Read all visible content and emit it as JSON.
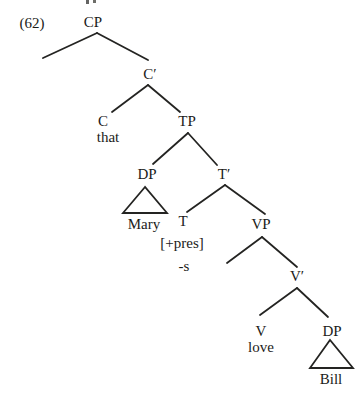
{
  "figure": {
    "example_number": "(62)",
    "kind": "syntax-tree",
    "ink_color": "#242422",
    "paper_color": "#ffffff",
    "sentence_pieces": [
      "that",
      "Mary",
      "[+pres]",
      "-s",
      "love",
      "Bill"
    ]
  },
  "tree": {
    "nodes": [
      {
        "id": "cp",
        "label": "CP",
        "x": 93,
        "y": 22
      },
      {
        "id": "c-bar",
        "label": "C′",
        "x": 150,
        "y": 74
      },
      {
        "id": "c",
        "label": "C",
        "x": 103,
        "y": 121
      },
      {
        "id": "c-word-that",
        "label": "that",
        "x": 108,
        "y": 137
      },
      {
        "id": "tp",
        "label": "TP",
        "x": 187,
        "y": 121
      },
      {
        "id": "dp-subject",
        "label": "DP",
        "x": 147,
        "y": 174
      },
      {
        "id": "dp-word-mary",
        "label": "Mary",
        "x": 144,
        "y": 224
      },
      {
        "id": "t-bar",
        "label": "T′",
        "x": 224,
        "y": 174
      },
      {
        "id": "t",
        "label": "T",
        "x": 183,
        "y": 221
      },
      {
        "id": "t-feature",
        "label": "[+pres]",
        "x": 182,
        "y": 243
      },
      {
        "id": "t-affix",
        "label": "-s",
        "x": 184,
        "y": 266
      },
      {
        "id": "vp",
        "label": "VP",
        "x": 261,
        "y": 224
      },
      {
        "id": "v-bar",
        "label": "V′",
        "x": 297,
        "y": 276
      },
      {
        "id": "v",
        "label": "V",
        "x": 261,
        "y": 331
      },
      {
        "id": "v-word-love",
        "label": "love",
        "x": 261,
        "y": 347
      },
      {
        "id": "dp-object",
        "label": "DP",
        "x": 332,
        "y": 331
      },
      {
        "id": "dp-word-bill",
        "label": "Bill",
        "x": 331,
        "y": 379
      }
    ],
    "edges": [
      {
        "name": "edge-cp-specifier",
        "x1": 97,
        "y1": 33,
        "x2": 43,
        "y2": 58
      },
      {
        "name": "edge-cp-cbar",
        "x1": 97,
        "y1": 33,
        "x2": 148,
        "y2": 60
      },
      {
        "name": "edge-cbar-c",
        "x1": 148,
        "y1": 85,
        "x2": 112,
        "y2": 112
      },
      {
        "name": "edge-cbar-tp",
        "x1": 148,
        "y1": 85,
        "x2": 180,
        "y2": 112
      },
      {
        "name": "edge-tp-dp",
        "x1": 188,
        "y1": 133,
        "x2": 153,
        "y2": 164
      },
      {
        "name": "edge-tp-tbar",
        "x1": 188,
        "y1": 133,
        "x2": 217,
        "y2": 165
      },
      {
        "name": "edge-tbar-t",
        "x1": 225,
        "y1": 185,
        "x2": 187,
        "y2": 212
      },
      {
        "name": "edge-tbar-vp",
        "x1": 225,
        "y1": 185,
        "x2": 265,
        "y2": 214
      },
      {
        "name": "edge-vp-specifier",
        "x1": 262,
        "y1": 237,
        "x2": 227,
        "y2": 263
      },
      {
        "name": "edge-vp-vbar",
        "x1": 262,
        "y1": 237,
        "x2": 297,
        "y2": 267
      },
      {
        "name": "edge-vbar-v",
        "x1": 297,
        "y1": 288,
        "x2": 260,
        "y2": 315
      },
      {
        "name": "edge-vbar-dp",
        "x1": 297,
        "y1": 288,
        "x2": 328,
        "y2": 317
      }
    ],
    "triangles": [
      {
        "name": "triangle-dp-mary",
        "apex_x": 145,
        "apex_y": 187,
        "base_left_x": 123,
        "base_right_x": 167,
        "base_y": 213
      },
      {
        "name": "triangle-dp-bill",
        "apex_x": 330,
        "apex_y": 340,
        "base_left_x": 310,
        "base_right_x": 353,
        "base_y": 368
      }
    ]
  }
}
